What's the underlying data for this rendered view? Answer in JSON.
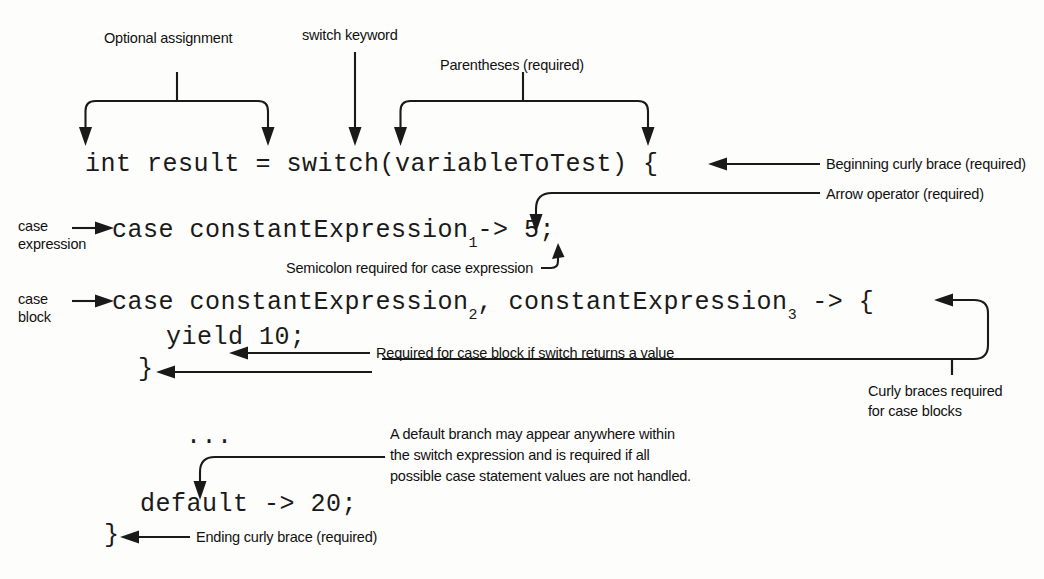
{
  "figure": {
    "type": "annotated-code-diagram",
    "background_color": "#fdfdfb",
    "ink_color": "#1a1a1a"
  },
  "code": {
    "line1": "int result = switch(variableToTest) {",
    "line2_pre": "case constantExpression",
    "line2_sub": "1",
    "line2_post": "-> 5;",
    "line3_pre": "case constantExpression",
    "line3_sub_a": "2",
    "line3_mid": ", constantExpression",
    "line3_sub_b": "3",
    "line3_post": " -> {",
    "line4": "yield 10;",
    "line5": "}",
    "line6": "...",
    "line7": "default -> 20;",
    "line8": "}"
  },
  "callouts": {
    "optional_assignment": "Optional assignment",
    "switch_keyword": "switch keyword",
    "parentheses_required": "Parentheses (required)",
    "beginning_curly_brace": "Beginning curly brace (required)",
    "arrow_operator": "Arrow operator (required)",
    "semicolon_required": "Semicolon required for case expression",
    "case_expression_l1": "case",
    "case_expression_l2": "expression",
    "case_block_l1": "case",
    "case_block_l2": "block",
    "required_for_case_block": "Required for case block if switch returns a value",
    "curly_braces_required_l1": "Curly braces required",
    "curly_braces_required_l2": "for case blocks",
    "default_branch_l1": "A default branch may appear anywhere within",
    "default_branch_l2": "the switch expression and is required if all",
    "default_branch_l3": "possible case statement values are not handled.",
    "ending_curly_brace": "Ending curly brace (required)"
  }
}
